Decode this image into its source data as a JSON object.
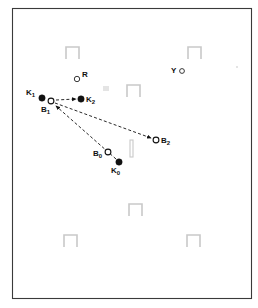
{
  "figure": {
    "type": "schematic-diagram",
    "caption": "",
    "canvas": {
      "width": 258,
      "height": 308,
      "background": "#ffffff"
    },
    "frame": {
      "x": 12,
      "y": 8,
      "width": 240,
      "height": 291,
      "stroke": "#3a3a3a"
    }
  },
  "colors": {
    "ink": "#111111",
    "obstacle_gray": "#c9c9c9",
    "frame": "#3a3a3a",
    "background": "#ffffff",
    "smudge_gray": "#e4e4e4"
  },
  "nodes": [
    {
      "id": "K1",
      "label": "K",
      "subscript": "1",
      "marker": "filled-circle",
      "x": 42,
      "y": 98,
      "r": 3.2,
      "label_x": 26,
      "label_y": 95
    },
    {
      "id": "K2",
      "label": "K",
      "subscript": "2",
      "marker": "filled-circle",
      "x": 81,
      "y": 99,
      "r": 3.2,
      "label_x": 86,
      "label_y": 102
    },
    {
      "id": "K0",
      "label": "K",
      "subscript": "0",
      "marker": "filled-circle",
      "x": 119,
      "y": 162,
      "r": 3.2,
      "label_x": 111,
      "label_y": 173
    },
    {
      "id": "B1",
      "label": "B",
      "subscript": "1",
      "marker": "open-circle",
      "x": 51,
      "y": 101,
      "r": 2.9,
      "label_x": 41,
      "label_y": 112
    },
    {
      "id": "B2",
      "label": "B",
      "subscript": "2",
      "marker": "open-circle",
      "x": 156,
      "y": 140,
      "r": 2.9,
      "label_x": 161,
      "label_y": 143
    },
    {
      "id": "B0",
      "label": "B",
      "subscript": "0",
      "marker": "open-circle",
      "x": 108,
      "y": 152,
      "r": 2.9,
      "label_x": 93,
      "label_y": 156
    },
    {
      "id": "R",
      "label": "R",
      "subscript": "",
      "marker": "open-circle",
      "x": 77,
      "y": 79,
      "r": 2.7,
      "label_x": 82,
      "label_y": 77
    },
    {
      "id": "Y",
      "label": "Y",
      "subscript": "",
      "marker": "open-circle",
      "x": 182,
      "y": 71,
      "r": 2.4,
      "label_x": 171,
      "label_y": 70
    }
  ],
  "paths": [
    {
      "id": "B1-to-K2",
      "from": "B1",
      "to": "K2",
      "style": "dashed",
      "arrowhead": "end",
      "x1": 56,
      "y1": 100,
      "x2": 76,
      "y2": 99
    },
    {
      "id": "B1-to-B2",
      "from": "B1",
      "to": "B2",
      "style": "dashed",
      "arrowhead": "end",
      "x1": 55,
      "y1": 103,
      "x2": 151,
      "y2": 138
    },
    {
      "id": "K0-to-B1",
      "from": "K0",
      "to": "B1",
      "style": "dashed",
      "arrowhead": "end",
      "x1": 116,
      "y1": 159,
      "x2": 55,
      "y2": 106
    }
  ],
  "obstacles": [
    {
      "id": "obstacle-1",
      "shape": "inverted-u",
      "x": 66,
      "y": 47,
      "width": 13,
      "height": 12
    },
    {
      "id": "obstacle-2",
      "shape": "inverted-u",
      "x": 188,
      "y": 47,
      "width": 13,
      "height": 12
    },
    {
      "id": "obstacle-3",
      "shape": "inverted-u",
      "x": 127,
      "y": 85,
      "width": 13,
      "height": 12
    },
    {
      "id": "obstacle-4",
      "shape": "inverted-u",
      "x": 129,
      "y": 204,
      "width": 13,
      "height": 12
    },
    {
      "id": "obstacle-5",
      "shape": "inverted-u",
      "x": 64,
      "y": 235,
      "width": 13,
      "height": 12
    },
    {
      "id": "obstacle-6",
      "shape": "inverted-u",
      "x": 187,
      "y": 235,
      "width": 13,
      "height": 12
    }
  ],
  "markers_misc": [
    {
      "id": "vertical-bar",
      "shape": "vertical-bar",
      "x": 130,
      "y": 140,
      "width": 3,
      "height": 17
    },
    {
      "id": "smudge-1",
      "shape": "rect",
      "x": 103,
      "y": 86,
      "width": 6,
      "height": 5
    },
    {
      "id": "smudge-2",
      "shape": "rect",
      "x": 236,
      "y": 66,
      "width": 2,
      "height": 2
    }
  ]
}
